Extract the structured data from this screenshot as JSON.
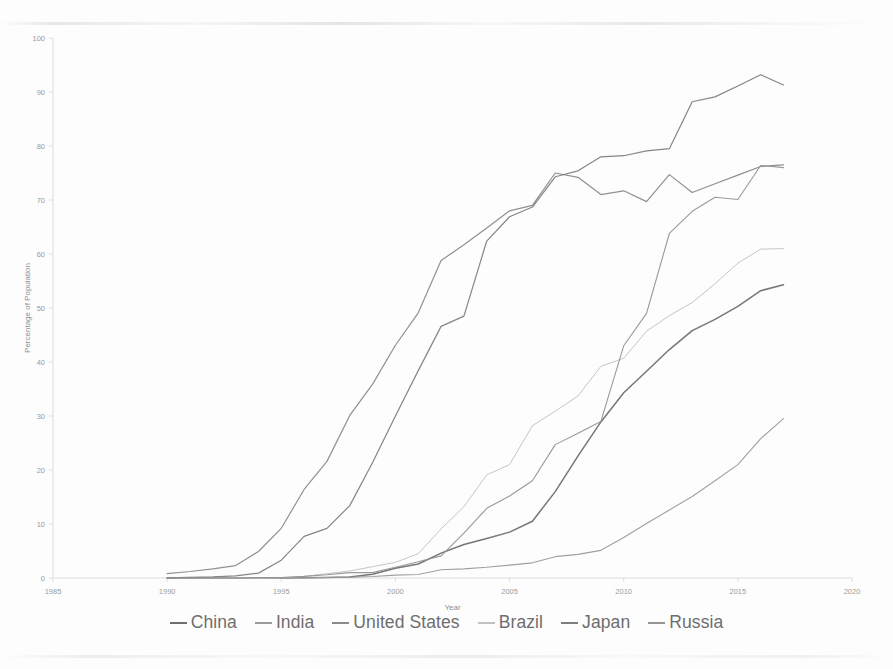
{
  "chart_data": {
    "type": "line",
    "title": "",
    "xlabel": "Year",
    "ylabel": "Percentage of Population",
    "xlim": [
      1985,
      2020
    ],
    "ylim": [
      0,
      100
    ],
    "xticks": [
      1985,
      1990,
      1995,
      2000,
      2005,
      2010,
      2015,
      2020
    ],
    "yticks": [
      0,
      10,
      20,
      30,
      40,
      50,
      60,
      70,
      80,
      90,
      100
    ],
    "grid": false,
    "legend_position": "bottom",
    "x": [
      1990,
      1991,
      1992,
      1993,
      1994,
      1995,
      1996,
      1997,
      1998,
      1999,
      2000,
      2001,
      2002,
      2003,
      2004,
      2005,
      2006,
      2007,
      2008,
      2009,
      2010,
      2011,
      2012,
      2013,
      2014,
      2015,
      2016,
      2017
    ],
    "series": [
      {
        "name": "China",
        "color": "#6f6f6f",
        "width": 1.5,
        "values": [
          0,
          0,
          0,
          0,
          0,
          0,
          0.03,
          0.1,
          0.2,
          0.7,
          1.8,
          2.6,
          4.6,
          6.2,
          7.3,
          8.5,
          10.5,
          16.0,
          22.6,
          28.9,
          34.3,
          38.3,
          42.3,
          45.8,
          47.9,
          50.3,
          53.2,
          54.3
        ]
      },
      {
        "name": "India",
        "color": "#9b9b9b",
        "width": 1.1,
        "values": [
          0,
          0,
          0,
          0,
          0,
          0,
          0.05,
          0.1,
          0.14,
          0.27,
          0.53,
          0.66,
          1.54,
          1.69,
          1.98,
          2.39,
          2.81,
          3.95,
          4.38,
          5.12,
          7.5,
          10.1,
          12.6,
          15.1,
          18.0,
          21.0,
          25.8,
          29.5
        ]
      },
      {
        "name": "United States",
        "color": "#8a8a8a",
        "width": 1.2,
        "values": [
          0.8,
          1.2,
          1.7,
          2.3,
          4.9,
          9.2,
          16.4,
          21.6,
          30.1,
          35.9,
          43.1,
          49.1,
          58.8,
          61.7,
          64.8,
          68.0,
          69.0,
          75.0,
          74.2,
          71.0,
          71.7,
          69.7,
          74.7,
          71.4,
          73.0,
          74.6,
          76.2,
          76.5
        ]
      },
      {
        "name": "Brazil",
        "color": "#c2c2c2",
        "width": 1.0,
        "values": [
          0,
          0,
          0,
          0,
          0,
          0.05,
          0.3,
          0.8,
          1.3,
          2.1,
          2.9,
          4.5,
          9.1,
          13.2,
          19.1,
          21.0,
          28.2,
          30.9,
          33.7,
          39.2,
          40.7,
          45.7,
          48.6,
          51.0,
          54.5,
          58.3,
          60.9,
          61.0
        ]
      },
      {
        "name": "Japan",
        "color": "#7e7e7e",
        "width": 1.2,
        "values": [
          0.02,
          0.1,
          0.2,
          0.4,
          0.9,
          3.3,
          7.7,
          9.2,
          13.4,
          21.4,
          30.0,
          38.4,
          46.6,
          48.5,
          62.4,
          66.9,
          68.7,
          74.3,
          75.4,
          78.0,
          78.2,
          79.1,
          79.5,
          88.2,
          89.1,
          91.1,
          93.2,
          91.3
        ]
      },
      {
        "name": "Russia",
        "color": "#949494",
        "width": 1.1,
        "values": [
          0,
          0,
          0,
          0,
          0.1,
          0.1,
          0.3,
          0.6,
          1.0,
          1.0,
          2.0,
          3.0,
          4.1,
          8.3,
          12.9,
          15.2,
          18.0,
          24.7,
          26.8,
          29.0,
          43.0,
          49.0,
          63.8,
          67.9,
          70.5,
          70.1,
          76.4,
          76.0
        ]
      }
    ]
  },
  "axes": {
    "y_axis_title": "Percentage of Population",
    "x_axis_title": "Year",
    "y_tick_labels": [
      "0",
      "10",
      "20",
      "30",
      "40",
      "50",
      "60",
      "70",
      "80",
      "90",
      "100"
    ],
    "x_tick_labels": [
      "1985",
      "1990",
      "1995",
      "2000",
      "2005",
      "2010",
      "2015",
      "2020"
    ]
  },
  "legend": {
    "items": [
      {
        "label": "China"
      },
      {
        "label": "India"
      },
      {
        "label": "United States"
      },
      {
        "label": "Brazil"
      },
      {
        "label": "Japan"
      },
      {
        "label": "Russia"
      }
    ]
  }
}
